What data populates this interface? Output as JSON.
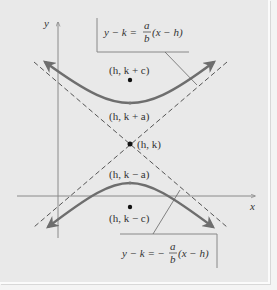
{
  "diagram": {
    "axes": {
      "x_label": "x",
      "y_label": "y"
    },
    "points": {
      "upper_focus": "(h, k + c)",
      "upper_vertex": "(h, k + a)",
      "center": "(h, k)",
      "lower_vertex": "(h, k − a)",
      "lower_focus": "(h, k − c)"
    },
    "asymptotes": {
      "positive": {
        "lhs": "y − k = ",
        "num": "a",
        "den": "b",
        "rhs": "(x − h)"
      },
      "negative": {
        "lhs": "y − k = −",
        "num": "a",
        "den": "b",
        "rhs": "(x − h)"
      }
    },
    "colors": {
      "background": "#e9e9e9",
      "curve": "#6e6e6e",
      "axis": "#8a8a8a",
      "asymptote": "#555555",
      "text": "#333333"
    }
  }
}
